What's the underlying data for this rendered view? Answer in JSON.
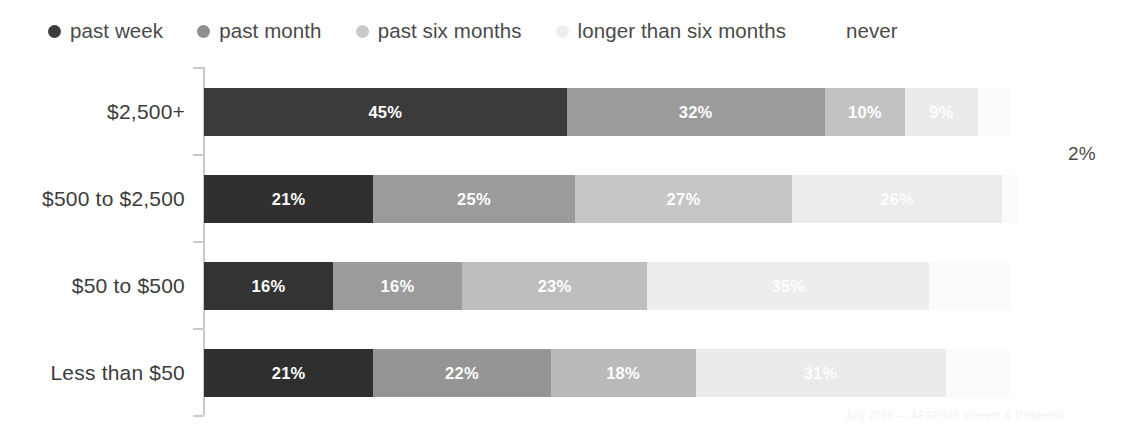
{
  "chart_data": {
    "type": "bar",
    "subtype": "horizontal-100-percent-stacked",
    "title": "",
    "subtitle": "",
    "xlabel": "",
    "ylabel": "",
    "xlim": [
      0,
      100
    ],
    "grid": false,
    "legend_position": "top",
    "categories": [
      "$2,500+",
      "$500 to $2,500",
      "$50 to $500",
      "Less than $50"
    ],
    "series": [
      {
        "name": "past week",
        "color": "#3b3b3b",
        "values": [
          45,
          21,
          16,
          21
        ]
      },
      {
        "name": "past month",
        "color": "#9b9b9b",
        "values": [
          32,
          25,
          16,
          22
        ]
      },
      {
        "name": "past six months",
        "color": "#c2c2c2",
        "values": [
          10,
          27,
          23,
          18
        ]
      },
      {
        "name": "longer than six months",
        "color": "#ebebeb",
        "values": [
          9,
          26,
          35,
          31
        ]
      },
      {
        "name": "never",
        "color": "#fbfbfb",
        "values": [
          4,
          2,
          10,
          8
        ]
      }
    ],
    "annotations": [
      {
        "text": "2%",
        "category": "$500 to $2,500",
        "series": "never",
        "placement": "outside-right"
      }
    ]
  },
  "legend": {
    "items": [
      {
        "label": "past week",
        "color": "#3b3b3b",
        "dot_visible": true
      },
      {
        "label": "past month",
        "color": "#8f8f8f",
        "dot_visible": true
      },
      {
        "label": "past six months",
        "color": "#c9c9c9",
        "dot_visible": true
      },
      {
        "label": "longer than six months",
        "color": "#eeeeee",
        "dot_visible": true
      },
      {
        "label": "never",
        "color": "#ffffff",
        "dot_visible": false
      }
    ]
  },
  "rows": [
    {
      "category": "$2,500+",
      "segments": [
        {
          "label": "45%",
          "value": 45,
          "color": "#3b3b3b",
          "label_visible": true,
          "label_style": "light"
        },
        {
          "label": "32%",
          "value": 32,
          "color": "#9b9b9b",
          "label_visible": true,
          "label_style": "light"
        },
        {
          "label": "10%",
          "value": 10,
          "color": "#c2c2c2",
          "label_visible": true,
          "label_style": "light"
        },
        {
          "label": "9%",
          "value": 9,
          "color": "#ebebeb",
          "label_visible": true,
          "label_style": "muted"
        },
        {
          "label": "4%",
          "value": 4,
          "color": "#fbfbfb",
          "label_visible": false,
          "label_style": "muted"
        }
      ],
      "outside_label": ""
    },
    {
      "category": "$500 to $2,500",
      "segments": [
        {
          "label": "21%",
          "value": 21,
          "color": "#303030",
          "label_visible": true,
          "label_style": "light"
        },
        {
          "label": "25%",
          "value": 25,
          "color": "#9b9b9b",
          "label_visible": true,
          "label_style": "light"
        },
        {
          "label": "27%",
          "value": 27,
          "color": "#c6c6c6",
          "label_visible": true,
          "label_style": "light"
        },
        {
          "label": "26%",
          "value": 26,
          "color": "#ececec",
          "label_visible": true,
          "label_style": "muted"
        },
        {
          "label": "2%",
          "value": 2,
          "color": "#fbfbfb",
          "label_visible": false,
          "label_style": "muted"
        }
      ],
      "outside_label": "2%"
    },
    {
      "category": "$50 to $500",
      "segments": [
        {
          "label": "16%",
          "value": 16,
          "color": "#333333",
          "label_visible": true,
          "label_style": "light"
        },
        {
          "label": "16%",
          "value": 16,
          "color": "#9b9b9b",
          "label_visible": true,
          "label_style": "light"
        },
        {
          "label": "23%",
          "value": 23,
          "color": "#bdbdbd",
          "label_visible": true,
          "label_style": "light"
        },
        {
          "label": "35%",
          "value": 35,
          "color": "#ededed",
          "label_visible": true,
          "label_style": "muted"
        },
        {
          "label": "10%",
          "value": 10,
          "color": "#fbfbfb",
          "label_visible": false,
          "label_style": "muted"
        }
      ],
      "outside_label": ""
    },
    {
      "category": "Less than $50",
      "segments": [
        {
          "label": "21%",
          "value": 21,
          "color": "#2f2f2f",
          "label_visible": true,
          "label_style": "light"
        },
        {
          "label": "22%",
          "value": 22,
          "color": "#959595",
          "label_visible": true,
          "label_style": "light"
        },
        {
          "label": "18%",
          "value": 18,
          "color": "#bababa",
          "label_visible": true,
          "label_style": "light"
        },
        {
          "label": "31%",
          "value": 31,
          "color": "#ebebeb",
          "label_visible": true,
          "label_style": "muted"
        },
        {
          "label": "8%",
          "value": 8,
          "color": "#fbfbfb",
          "label_visible": false,
          "label_style": "muted"
        }
      ],
      "outside_label": ""
    }
  ],
  "footer": {
    "credit": "July 2019 — AFSP/US Interest & Dividends"
  }
}
